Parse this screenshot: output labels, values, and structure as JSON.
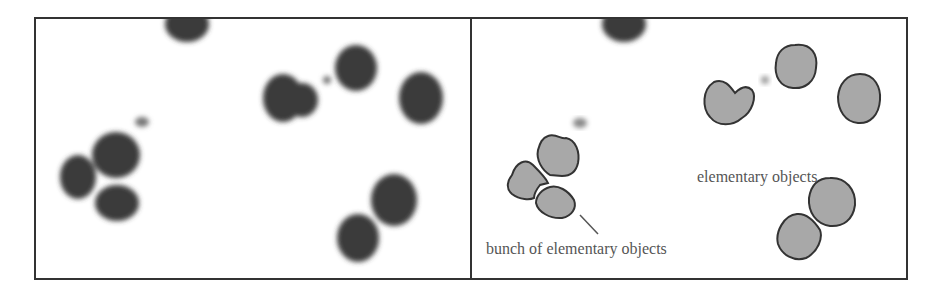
{
  "figure": {
    "left_panel": {
      "description": "original micrograph of dark blobs"
    },
    "right_panel": {
      "description": "segmented objects with outlined contours",
      "labels": {
        "elementary": "elementary objects",
        "bunch": "bunch of elementary objects"
      }
    }
  },
  "colors": {
    "frame": "#333333",
    "blob_dark": "#3a3a3a",
    "blob_segmented_fill": "#a8a8a8",
    "contour": "#333333",
    "text": "#555555"
  }
}
